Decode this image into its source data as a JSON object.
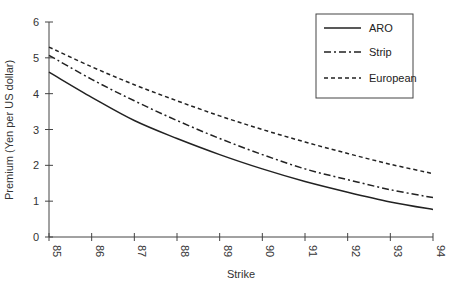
{
  "chart_data": {
    "type": "line",
    "title": "",
    "xlabel": "Strike",
    "ylabel": "Premium (Yen per US dollar)",
    "x": [
      85,
      86,
      87,
      88,
      89,
      90,
      91,
      92,
      93,
      94
    ],
    "xlim": [
      85,
      94
    ],
    "ylim": [
      0,
      6
    ],
    "xticks": [
      "85",
      "86",
      "87",
      "88",
      "89",
      "90",
      "91",
      "92",
      "93",
      "94"
    ],
    "yticks": [
      "0",
      "1",
      "2",
      "3",
      "4",
      "5",
      "6"
    ],
    "grid": false,
    "legend_position": "top-right",
    "series": [
      {
        "name": "ARO",
        "style": "solid",
        "values": [
          4.6,
          3.9,
          3.25,
          2.75,
          2.3,
          1.9,
          1.55,
          1.25,
          0.98,
          0.77
        ]
      },
      {
        "name": "Strip",
        "style": "dash-dot",
        "values": [
          5.07,
          4.4,
          3.8,
          3.25,
          2.75,
          2.3,
          1.9,
          1.6,
          1.32,
          1.1
        ]
      },
      {
        "name": "European",
        "style": "dashed",
        "values": [
          5.3,
          4.75,
          4.25,
          3.8,
          3.38,
          3.0,
          2.65,
          2.33,
          2.03,
          1.77
        ]
      }
    ]
  },
  "legend": {
    "items": [
      {
        "label": "ARO"
      },
      {
        "label": "Strip"
      },
      {
        "label": "European"
      }
    ]
  },
  "colors": {
    "line": "#222222",
    "axis": "#444444"
  }
}
